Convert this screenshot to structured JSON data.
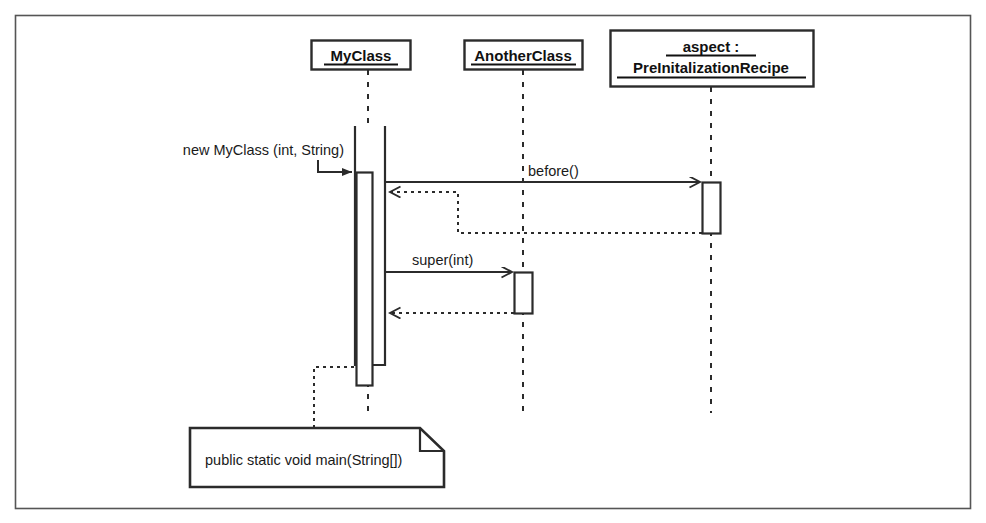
{
  "diagram": {
    "kind": "uml-sequence-diagram",
    "border_color": "#555555",
    "line_color": "#2b2b2b",
    "background": "#ffffff",
    "lifelines": [
      {
        "id": "myclass",
        "label_lines": [
          "MyClass"
        ],
        "underlined": true
      },
      {
        "id": "anotherclass",
        "label_lines": [
          "AnotherClass"
        ],
        "underlined": true
      },
      {
        "id": "aspect",
        "label_lines": [
          "aspect :",
          "PreInitalizationRecipe"
        ],
        "underlined": true
      }
    ],
    "messages": [
      {
        "id": "constructor",
        "label": "new MyClass (int, String)",
        "style": "solid",
        "arrowhead": "filled",
        "from": "actor",
        "to": "myclass"
      },
      {
        "id": "before-advice",
        "label": "before()",
        "style": "solid",
        "arrowhead": "open",
        "from": "myclass",
        "to": "aspect"
      },
      {
        "id": "before-return",
        "label": "",
        "style": "dashed",
        "arrowhead": "open",
        "from": "aspect",
        "to": "myclass"
      },
      {
        "id": "super-call",
        "label": "super(int)",
        "style": "solid",
        "arrowhead": "open",
        "from": "myclass",
        "to": "anotherclass"
      },
      {
        "id": "super-return",
        "label": "",
        "style": "dashed",
        "arrowhead": "open",
        "from": "anotherclass",
        "to": "myclass"
      }
    ],
    "note": {
      "text": "public static void main(String[])",
      "attached_to": "myclass"
    }
  }
}
